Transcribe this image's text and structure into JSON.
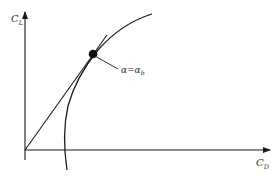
{
  "diagram": {
    "y_axis_label": "C",
    "y_axis_sub": "L",
    "x_axis_label": "C",
    "x_axis_sub": "D",
    "point_label": "α=α",
    "point_label_sub": "b",
    "colors": {
      "line": "#1a1a1a",
      "text": "#333333",
      "background": "#ffffff"
    }
  }
}
